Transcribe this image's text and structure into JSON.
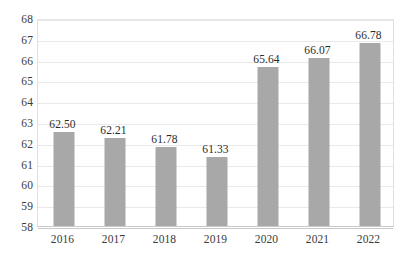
{
  "chart_data": {
    "type": "bar",
    "title": "",
    "subtitle": "",
    "xlabel": "",
    "ylabel": "",
    "categories": [
      "2016",
      "2017",
      "2018",
      "2019",
      "2020",
      "2021",
      "2022"
    ],
    "values": [
      62.5,
      62.21,
      61.78,
      61.33,
      65.64,
      66.07,
      66.78
    ],
    "data_labels": [
      "62.50",
      "62.21",
      "61.78",
      "61.33",
      "65.64",
      "66.07",
      "66.78"
    ],
    "ylim": [
      58,
      68
    ],
    "y_ticks": [
      58,
      59,
      60,
      61,
      62,
      63,
      64,
      65,
      66,
      67,
      68
    ],
    "y_tick_labels": [
      "58",
      "59",
      "60",
      "61",
      "62",
      "63",
      "64",
      "65",
      "66",
      "67",
      "68"
    ],
    "grid": true,
    "grid_axis": "y",
    "legend": false,
    "legend_position": "none",
    "bar_color": "#a8a8a8",
    "grid_color": "#e9e9e9",
    "axis_color": "#c9c9c9",
    "background_color": "#ffffff",
    "text_color": "#3a3a3a"
  }
}
